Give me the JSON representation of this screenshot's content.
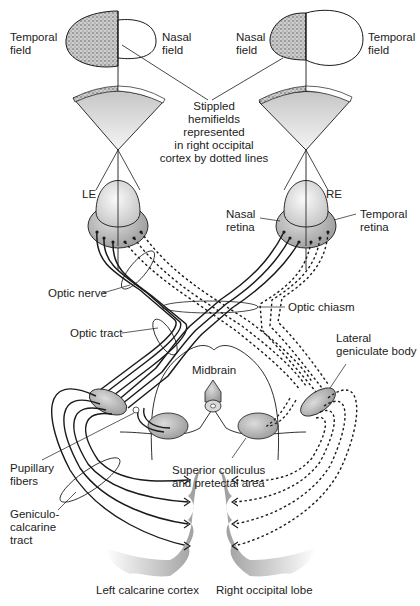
{
  "labels": {
    "left_temporal_field": [
      "Temporal",
      "field"
    ],
    "left_nasal_field": [
      "Nasal",
      "field"
    ],
    "right_nasal_field": [
      "Nasal",
      "field"
    ],
    "right_temporal_field": [
      "Temporal",
      "field"
    ],
    "stippled_note": [
      "Stippled",
      "hemifields",
      "represented",
      "in right occipital",
      "cortex by dotted lines"
    ],
    "left_eye": "LE",
    "right_eye": "RE",
    "nasal_retina": [
      "Nasal",
      "retina"
    ],
    "temporal_retina": [
      "Temporal",
      "retina"
    ],
    "optic_nerve": "Optic nerve",
    "optic_chiasm": "Optic chiasm",
    "optic_tract": "Optic tract",
    "lateral_geniculate_body": [
      "Lateral",
      "geniculate body"
    ],
    "midbrain": "Midbrain",
    "pupillary_fibers": [
      "Pupillary",
      "fibers"
    ],
    "superior_colliculus": [
      "Superior colliculus",
      "and pretectal area"
    ],
    "geniculocalcarine_tract": [
      "Geniculo-",
      "calcarine",
      "tract"
    ],
    "left_calcarine_cortex": "Left calcarine cortex",
    "right_occipital_lobe": "Right occipital lobe"
  },
  "legend": {
    "solid_lines": "Left temporal / right nasal hemifield fibers (to left cortex)",
    "dotted_lines": "Stippled hemifields represented in right occipital cortex"
  },
  "colors": {
    "line": "#1a1a1a",
    "structure_fill": "#b8b8b8",
    "eye_fill": "#e6e6e6",
    "fan_fill": "#d4d4d4",
    "cortex_shade": "#c8c8c8"
  }
}
